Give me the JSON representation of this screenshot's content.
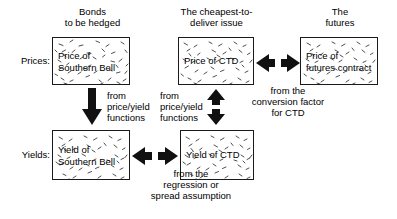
{
  "diagram": {
    "title_row_labels": {
      "prices": "Prices:",
      "yields": "Yields:"
    },
    "column_headings": {
      "left": "Bonds\nto be hedged",
      "middle": "The cheapest-to-\ndeliver issue",
      "right": "The\nfutures"
    },
    "boxes": {
      "price_southern_bell": "Price of\nSouthern Bell",
      "price_ctd": "Price of CTD",
      "price_futures": "Price of\nfutures contract",
      "yield_southern_bell": "Yield of\nSouthern Bell",
      "yield_ctd": "Yield of CTD"
    },
    "captions": {
      "left_vertical": "from\nprice/yield\nfunctions",
      "middle_vertical": "from\nprice/yield\nfunctions",
      "top_horizontal": "from the\nconversion factor\nfor CTD",
      "bottom_horizontal": "from the\nregression or\nspread assumption"
    },
    "arrow_names": {
      "left_down": "arrow-down-price-to-yield-southern-bell",
      "middle_updown": "arrow-updown-price-yield-ctd",
      "top_leftright": "arrow-leftright-ctd-futures",
      "bottom_leftright": "arrow-leftright-yield-southern-bell-ctd"
    },
    "colors": {
      "ink": "#1a1a1a",
      "background": "#ffffff"
    }
  }
}
